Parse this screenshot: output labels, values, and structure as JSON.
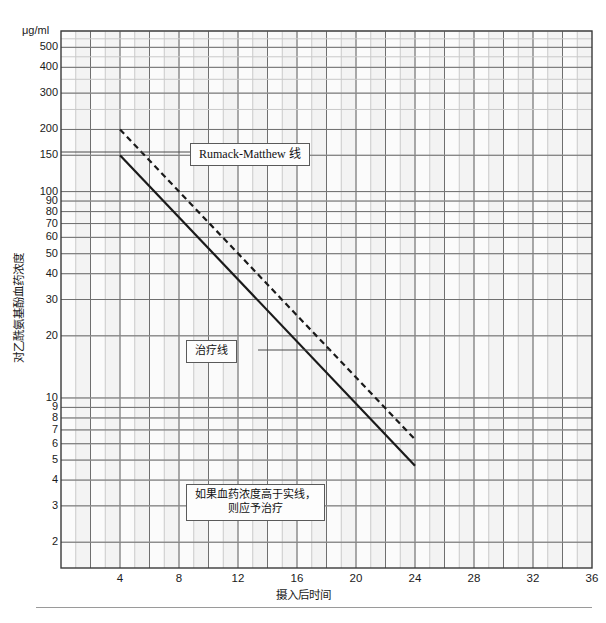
{
  "figure": {
    "unit_label": "μg/ml",
    "x_axis_label": "摄入后时间",
    "y_axis_label": "对乙酰氨基酚血药浓度"
  },
  "annotations": {
    "rumack_matthew": "Rumack-Matthew 线",
    "treatment_line": "治疗线",
    "note_line1": "如果血药浓度高于实线，",
    "note_line2": "则应予治疗"
  },
  "colors": {
    "line": "#1a1a1a",
    "grid_major": "#6f6f6f",
    "grid_minor": "#c9c9c9",
    "frame": "#3a3a3a",
    "plot_bg": "#fbfbfb",
    "band_bg": "#f1f1f1"
  },
  "chart_data": {
    "type": "line",
    "title": "",
    "subtitle": "",
    "xlabel": "摄入后时间",
    "ylabel": "对乙酰氨基酚血药浓度",
    "unit": "μg/ml",
    "xscale": "linear",
    "yscale": "log",
    "xlim": [
      0,
      36
    ],
    "ylim": [
      1.5,
      600
    ],
    "grid": true,
    "legend": "none",
    "x_ticks": [
      4,
      8,
      12,
      16,
      20,
      24,
      28,
      32,
      36
    ],
    "x_tick_labels": [
      "4",
      "8",
      "12",
      "16",
      "20",
      "24",
      "28",
      "32",
      "36"
    ],
    "x_minor_step": 1,
    "y_ticks": [
      500,
      400,
      300,
      200,
      150,
      100,
      90,
      80,
      70,
      60,
      50,
      40,
      30,
      20,
      10,
      9,
      8,
      7,
      6,
      5,
      4,
      3,
      2
    ],
    "y_tick_labels": [
      "500",
      "400",
      "300",
      "200",
      "150",
      "100",
      "90",
      "80",
      "70",
      "60",
      "50",
      "40",
      "30",
      "20",
      "10",
      "9",
      "8",
      "7",
      "6",
      "5",
      "4",
      "3",
      "2"
    ],
    "series": [
      {
        "name": "Rumack-Matthew 线",
        "style": "dashed",
        "x": [
          4,
          24
        ],
        "y": [
          200,
          6.3
        ]
      },
      {
        "name": "治疗线",
        "style": "solid",
        "x": [
          4,
          24
        ],
        "y": [
          150,
          4.7
        ]
      }
    ],
    "annotations": [
      {
        "text": "Rumack-Matthew 线",
        "x": 8.4,
        "y": 132,
        "points_to": {
          "x": 4.9,
          "y": 167
        }
      },
      {
        "text": "治疗线",
        "x": 9.1,
        "y": 14.5,
        "points_to": {
          "x": 14.2,
          "y": 14.5
        }
      },
      {
        "text": "如果血药浓度高于实线，则应予治疗",
        "x": 13.5,
        "y": 2.5
      }
    ]
  }
}
